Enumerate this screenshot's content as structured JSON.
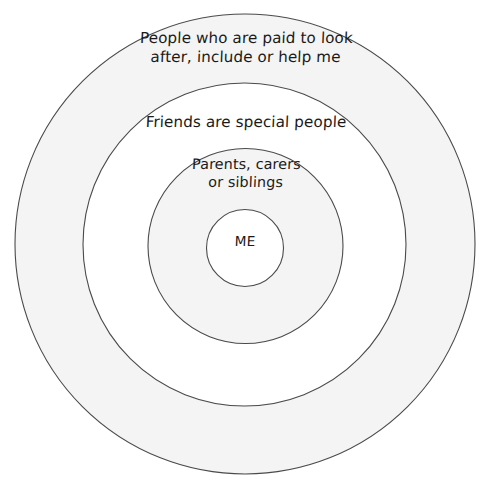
{
  "diagram": {
    "type": "concentric-circles",
    "background_color": "#ffffff",
    "stroke_color": "#4a4a4a",
    "text_color": "#1a1a1a",
    "rings": [
      {
        "id": "outer",
        "level": 4,
        "label": "People who are paid to look\nafter, include or help me",
        "fill_color": "#f4f4f4",
        "diameter": 462
      },
      {
        "id": "friends",
        "level": 3,
        "label": "Friends are special people",
        "fill_color": "#ffffff",
        "diameter": 324
      },
      {
        "id": "family",
        "level": 2,
        "label": "Parents, carers\nor siblings",
        "fill_color": "#f4f4f4",
        "diameter": 196
      },
      {
        "id": "me",
        "level": 1,
        "label": "ME",
        "fill_color": "#ffffff",
        "diameter": 78
      }
    ]
  }
}
